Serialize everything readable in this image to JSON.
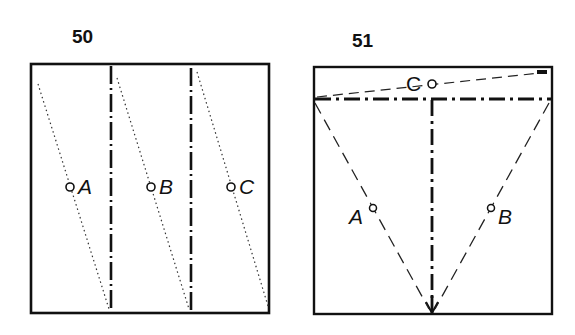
{
  "figures": [
    {
      "number": "50",
      "points": [
        {
          "label": "A"
        },
        {
          "label": "B"
        },
        {
          "label": "C"
        }
      ],
      "description": "Square divided into three vertical strips by two dash-dot lines; each strip has a dotted diagonal and a marked point"
    },
    {
      "number": "51",
      "points": [
        {
          "label": "C"
        },
        {
          "label": "A"
        },
        {
          "label": "B"
        }
      ],
      "description": "Square with a horizontal dash-dot line near the top, a vertical dash-dot line with arrow down to the bottom edge, two dashed lines forming a V, and a dashed slanted line in the top band"
    }
  ],
  "colors": {
    "ink": "#111111",
    "background": "#ffffff"
  }
}
